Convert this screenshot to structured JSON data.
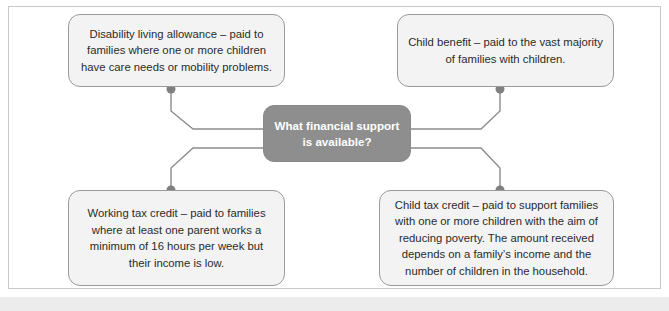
{
  "diagram": {
    "type": "mind-map",
    "center": {
      "id": "center",
      "text": "What financial support is available?",
      "line1": "What financial support",
      "line2": "is available?",
      "fill": "#8e8e8e",
      "text_color": "#ffffff"
    },
    "nodes": [
      {
        "id": "dla",
        "position": "top-left",
        "text": "Disability living allowance – paid to families where one or more children have care needs or mobility problems.",
        "fill": "#f3f3f3",
        "border": "#9a9a9a"
      },
      {
        "id": "cb",
        "position": "top-right",
        "text": "Child benefit – paid to the vast majority of families with children.",
        "fill": "#f3f3f3",
        "border": "#9a9a9a"
      },
      {
        "id": "wtc",
        "position": "bottom-left",
        "text": "Working tax credit – paid to families where at least one parent works a minimum of 16 hours per week but their income is low.",
        "fill": "#f3f3f3",
        "border": "#9a9a9a"
      },
      {
        "id": "ctc",
        "position": "bottom-right",
        "text": "Child tax credit – paid to support families with one or more children with the aim of reducing poverty. The amount received depends on a family’s income and the number of children in the household.",
        "fill": "#f3f3f3",
        "border": "#9a9a9a"
      }
    ],
    "connectors": {
      "line_color": "#8c8c8c",
      "dot_color": "#808080",
      "dot_radius": 4.5,
      "links": [
        {
          "from": "center",
          "to": "dla",
          "dot_x": 171,
          "dot_y": 89
        },
        {
          "from": "center",
          "to": "cb",
          "dot_x": 500,
          "dot_y": 89
        },
        {
          "from": "center",
          "to": "wtc",
          "dot_x": 171,
          "dot_y": 190
        },
        {
          "from": "center",
          "to": "ctc",
          "dot_x": 500,
          "dot_y": 190
        }
      ]
    },
    "frame": {
      "border_color": "#c9c9c9",
      "background": "#ffffff"
    },
    "footer_strip_color": "#ececed"
  }
}
